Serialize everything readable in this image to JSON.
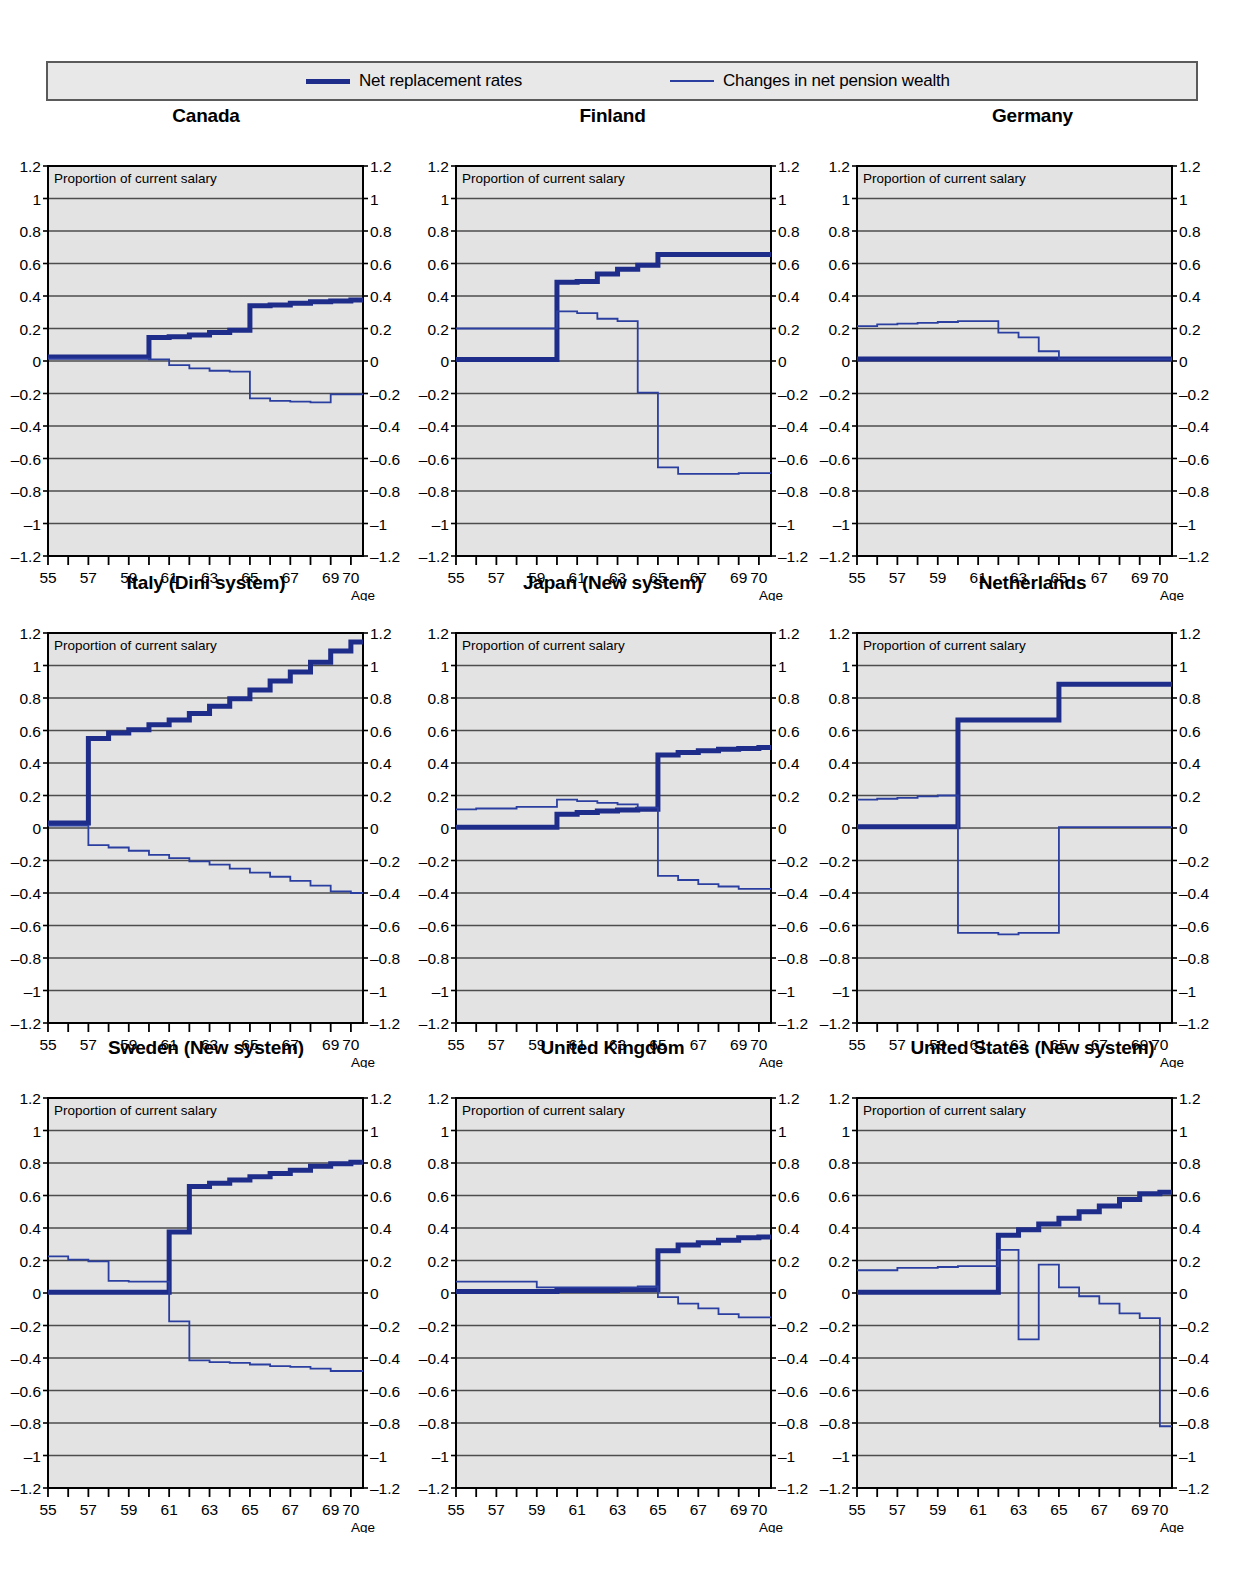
{
  "legend": {
    "entries": [
      {
        "label": "Net replacement rates",
        "style": "thick",
        "color": "#1f2d8a"
      },
      {
        "label": "Changes in net pension wealth",
        "style": "thin",
        "color": "#2b3fa0"
      }
    ]
  },
  "axis": {
    "y_ticks": [
      "1.2",
      "1",
      "0.8",
      "0.6",
      "0.4",
      "0.2",
      "0",
      "–0.2",
      "–0.4",
      "–0.6",
      "–0.8",
      "–1",
      "–1.2"
    ],
    "x_tick_labels": [
      "55",
      "57",
      "59",
      "61",
      "63",
      "65",
      "67",
      "69",
      "70"
    ],
    "x_caption": "Age",
    "inside_note": "Proportion of current salary",
    "ylim": [
      -1.2,
      1.2
    ],
    "xlim": [
      55,
      70.6
    ]
  },
  "colors": {
    "thick_line": "#1f2d8a",
    "thin_line": "#2b3fa0",
    "plot_background": "#e3e3e3",
    "gridline": "#4d4d4d",
    "frame": "#000000",
    "legend_background": "#e8e8e8",
    "legend_border": "#5a5a5a"
  },
  "chart_data": [
    {
      "type": "line",
      "title": "Canada",
      "xlabel": "Age",
      "ylabel": "Proportion of current salary",
      "xlim": [
        55,
        70.6
      ],
      "ylim": [
        -1.2,
        1.2
      ],
      "grid": true,
      "x": [
        55,
        56,
        57,
        58,
        59,
        60,
        61,
        62,
        63,
        64,
        65,
        66,
        67,
        68,
        69,
        70
      ],
      "series": [
        {
          "name": "Net replacement rates",
          "style": "thick",
          "values": [
            0.025,
            0.025,
            0.025,
            0.025,
            0.025,
            0.145,
            0.15,
            0.16,
            0.175,
            0.19,
            0.34,
            0.345,
            0.355,
            0.365,
            0.37,
            0.375
          ]
        },
        {
          "name": "Changes in net pension wealth",
          "style": "thin",
          "values": [
            0.015,
            0.015,
            0.015,
            0.015,
            0.015,
            0.01,
            -0.025,
            -0.045,
            -0.06,
            -0.065,
            -0.23,
            -0.245,
            -0.25,
            -0.255,
            -0.205,
            -0.205
          ]
        }
      ]
    },
    {
      "type": "line",
      "title": "Finland",
      "xlabel": "Age",
      "ylabel": "Proportion of current salary",
      "xlim": [
        55,
        70.6
      ],
      "ylim": [
        -1.2,
        1.2
      ],
      "grid": true,
      "x": [
        55,
        56,
        57,
        58,
        59,
        60,
        61,
        62,
        63,
        64,
        65,
        66,
        67,
        68,
        69,
        70
      ],
      "series": [
        {
          "name": "Net replacement rates",
          "style": "thick",
          "values": [
            0.01,
            0.01,
            0.01,
            0.01,
            0.01,
            0.485,
            0.49,
            0.535,
            0.565,
            0.59,
            0.655,
            0.655,
            0.655,
            0.655,
            0.655,
            0.655
          ]
        },
        {
          "name": "Changes in net pension wealth",
          "style": "thin",
          "values": [
            0.2,
            0.2,
            0.2,
            0.2,
            0.2,
            0.305,
            0.295,
            0.26,
            0.245,
            -0.195,
            -0.655,
            -0.695,
            -0.695,
            -0.695,
            -0.69,
            -0.69
          ]
        }
      ]
    },
    {
      "type": "line",
      "title": "Germany",
      "xlabel": "Age",
      "ylabel": "Proportion of current salary",
      "xlim": [
        55,
        70.6
      ],
      "ylim": [
        -1.2,
        1.2
      ],
      "grid": true,
      "x": [
        55,
        56,
        57,
        58,
        59,
        60,
        61,
        62,
        63,
        64,
        65,
        66,
        67,
        68,
        69,
        70
      ],
      "series": [
        {
          "name": "Net replacement rates",
          "style": "thick",
          "values": [
            0.012,
            0.012,
            0.012,
            0.012,
            0.012,
            0.012,
            0.012,
            0.012,
            0.012,
            0.012,
            0.012,
            0.012,
            0.012,
            0.012,
            0.012,
            0.012
          ]
        },
        {
          "name": "Changes in net pension wealth",
          "style": "thin",
          "values": [
            0.215,
            0.225,
            0.23,
            0.235,
            0.24,
            0.245,
            0.245,
            0.175,
            0.145,
            0.06,
            0.012,
            0.012,
            0.012,
            0.012,
            0.012,
            0.012
          ]
        }
      ]
    },
    {
      "type": "line",
      "title": "Italy (Dini system)",
      "xlabel": "Age",
      "ylabel": "Proportion of current salary",
      "xlim": [
        55,
        70.6
      ],
      "ylim": [
        -1.2,
        1.2
      ],
      "grid": true,
      "x": [
        55,
        56,
        57,
        58,
        59,
        60,
        61,
        62,
        63,
        64,
        65,
        66,
        67,
        68,
        69,
        70
      ],
      "series": [
        {
          "name": "Net replacement rates",
          "style": "thick",
          "values": [
            0.03,
            0.03,
            0.55,
            0.585,
            0.605,
            0.635,
            0.665,
            0.705,
            0.75,
            0.795,
            0.85,
            0.905,
            0.96,
            1.02,
            1.09,
            1.145
          ]
        },
        {
          "name": "Changes in net pension wealth",
          "style": "thin",
          "values": [
            0.015,
            0.015,
            -0.105,
            -0.12,
            -0.14,
            -0.165,
            -0.185,
            -0.205,
            -0.225,
            -0.25,
            -0.275,
            -0.3,
            -0.325,
            -0.355,
            -0.39,
            -0.4
          ]
        }
      ]
    },
    {
      "type": "line",
      "title": "Japan (New system)",
      "xlabel": "Age",
      "ylabel": "Proportion of current salary",
      "xlim": [
        55,
        70.6
      ],
      "ylim": [
        -1.2,
        1.2
      ],
      "grid": true,
      "x": [
        55,
        56,
        57,
        58,
        59,
        60,
        61,
        62,
        63,
        64,
        65,
        66,
        67,
        68,
        69,
        70
      ],
      "series": [
        {
          "name": "Net replacement rates",
          "style": "thick",
          "values": [
            0.005,
            0.005,
            0.005,
            0.005,
            0.005,
            0.085,
            0.095,
            0.105,
            0.11,
            0.115,
            0.45,
            0.465,
            0.475,
            0.485,
            0.49,
            0.495
          ]
        },
        {
          "name": "Changes in net pension wealth",
          "style": "thin",
          "values": [
            0.115,
            0.12,
            0.12,
            0.13,
            0.13,
            0.175,
            0.165,
            0.155,
            0.145,
            0.125,
            -0.295,
            -0.32,
            -0.345,
            -0.36,
            -0.375,
            -0.375
          ]
        }
      ]
    },
    {
      "type": "line",
      "title": "Netherlands",
      "xlabel": "Age",
      "ylabel": "Proportion of current salary",
      "xlim": [
        55,
        70.6
      ],
      "ylim": [
        -1.2,
        1.2
      ],
      "grid": true,
      "x": [
        55,
        56,
        57,
        58,
        59,
        60,
        61,
        62,
        63,
        64,
        65,
        66,
        67,
        68,
        69,
        70
      ],
      "series": [
        {
          "name": "Net replacement rates",
          "style": "thick",
          "values": [
            0.008,
            0.008,
            0.008,
            0.008,
            0.008,
            0.665,
            0.665,
            0.665,
            0.665,
            0.665,
            0.885,
            0.885,
            0.885,
            0.885,
            0.885,
            0.885
          ]
        },
        {
          "name": "Changes in net pension wealth",
          "style": "thin",
          "values": [
            0.175,
            0.18,
            0.185,
            0.195,
            0.2,
            -0.645,
            -0.645,
            -0.655,
            -0.645,
            -0.645,
            0.005,
            0.005,
            0.005,
            0.005,
            0.005,
            0.005
          ]
        }
      ]
    },
    {
      "type": "line",
      "title": "Sweden (New system)",
      "xlabel": "Age",
      "ylabel": "Proportion of current salary",
      "xlim": [
        55,
        70.6
      ],
      "ylim": [
        -1.2,
        1.2
      ],
      "grid": true,
      "x": [
        55,
        56,
        57,
        58,
        59,
        60,
        61,
        62,
        63,
        64,
        65,
        66,
        67,
        68,
        69,
        70
      ],
      "series": [
        {
          "name": "Net replacement rates",
          "style": "thick",
          "values": [
            0.005,
            0.005,
            0.005,
            0.005,
            0.005,
            0.005,
            0.375,
            0.655,
            0.675,
            0.695,
            0.715,
            0.735,
            0.755,
            0.78,
            0.795,
            0.805
          ]
        },
        {
          "name": "Changes in net pension wealth",
          "style": "thin",
          "values": [
            0.225,
            0.205,
            0.195,
            0.075,
            0.07,
            0.07,
            -0.175,
            -0.415,
            -0.425,
            -0.43,
            -0.44,
            -0.45,
            -0.455,
            -0.465,
            -0.48,
            -0.48
          ]
        }
      ]
    },
    {
      "type": "line",
      "title": "United Kingdom",
      "xlabel": "Age",
      "ylabel": "Proportion of current salary",
      "xlim": [
        55,
        70.6
      ],
      "ylim": [
        -1.2,
        1.2
      ],
      "grid": true,
      "x": [
        55,
        56,
        57,
        58,
        59,
        60,
        61,
        62,
        63,
        64,
        65,
        66,
        67,
        68,
        69,
        70
      ],
      "series": [
        {
          "name": "Net replacement rates",
          "style": "thick",
          "values": [
            0.01,
            0.01,
            0.01,
            0.01,
            0.01,
            0.015,
            0.015,
            0.015,
            0.02,
            0.02,
            0.26,
            0.295,
            0.31,
            0.325,
            0.34,
            0.345
          ]
        },
        {
          "name": "Changes in net pension wealth",
          "style": "thin",
          "values": [
            0.07,
            0.07,
            0.07,
            0.07,
            0.035,
            0.035,
            0.035,
            0.035,
            0.035,
            0.04,
            -0.025,
            -0.065,
            -0.095,
            -0.13,
            -0.15,
            -0.15
          ]
        }
      ]
    },
    {
      "type": "line",
      "title": "United States (New system)",
      "xlabel": "Age",
      "ylabel": "Proportion of current salary",
      "xlim": [
        55,
        70.6
      ],
      "ylim": [
        -1.2,
        1.2
      ],
      "grid": true,
      "x": [
        55,
        56,
        57,
        58,
        59,
        60,
        61,
        62,
        63,
        64,
        65,
        66,
        67,
        68,
        69,
        70
      ],
      "series": [
        {
          "name": "Net replacement rates",
          "style": "thick",
          "values": [
            0.005,
            0.005,
            0.005,
            0.005,
            0.005,
            0.005,
            0.005,
            0.355,
            0.39,
            0.425,
            0.46,
            0.5,
            0.535,
            0.575,
            0.61,
            0.62
          ]
        },
        {
          "name": "Changes in net pension wealth",
          "style": "thin",
          "values": [
            0.14,
            0.14,
            0.155,
            0.155,
            0.16,
            0.165,
            0.165,
            0.265,
            -0.285,
            0.175,
            0.035,
            -0.02,
            -0.065,
            -0.125,
            -0.155,
            -0.82
          ]
        }
      ]
    }
  ]
}
